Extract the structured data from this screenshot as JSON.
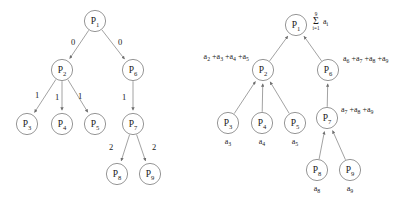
{
  "figure": {
    "background_color": "#ffffff",
    "stroke_color": "#8a8a8a",
    "text_color": "#1a1a1a",
    "left_diagram": {
      "name": "broadcast-tree-with-step-labels",
      "nodes": [
        {
          "id": "P1",
          "base": "P",
          "sub": "1",
          "x": 95,
          "y": 21
        },
        {
          "id": "P2",
          "base": "P",
          "sub": "2",
          "x": 62,
          "y": 70
        },
        {
          "id": "P6",
          "base": "P",
          "sub": "6",
          "x": 133,
          "y": 70
        },
        {
          "id": "P3",
          "base": "P",
          "sub": "3",
          "x": 27,
          "y": 124
        },
        {
          "id": "P4",
          "base": "P",
          "sub": "4",
          "x": 62,
          "y": 124
        },
        {
          "id": "P5",
          "base": "P",
          "sub": "5",
          "x": 95,
          "y": 124
        },
        {
          "id": "P7",
          "base": "P",
          "sub": "7",
          "x": 133,
          "y": 124
        },
        {
          "id": "P8",
          "base": "P",
          "sub": "8",
          "x": 117,
          "y": 174
        },
        {
          "id": "P9",
          "base": "P",
          "sub": "9",
          "x": 150,
          "y": 174
        }
      ],
      "edges": [
        {
          "from": "P1",
          "to": "P2",
          "weight": "0",
          "label_x": 73,
          "label_y": 45
        },
        {
          "from": "P1",
          "to": "P6",
          "weight": "0",
          "label_x": 120,
          "label_y": 45
        },
        {
          "from": "P2",
          "to": "P3",
          "weight": "1",
          "label_x": 37,
          "label_y": 98
        },
        {
          "from": "P2",
          "to": "P4",
          "weight": "1",
          "label_x": 57,
          "label_y": 100
        },
        {
          "from": "P2",
          "to": "P5",
          "weight": "1",
          "label_x": 80,
          "label_y": 99
        },
        {
          "from": "P6",
          "to": "P7",
          "weight": "1",
          "label_x": 124,
          "label_y": 100
        },
        {
          "from": "P7",
          "to": "P8",
          "weight": "2",
          "label_x": 111,
          "label_y": 150
        },
        {
          "from": "P7",
          "to": "P9",
          "weight": "2",
          "label_x": 154,
          "label_y": 150
        }
      ]
    },
    "right_diagram": {
      "name": "reduction-tree-with-partial-sums",
      "nodes": [
        {
          "id": "P1",
          "base": "P",
          "sub": "1",
          "x": 296,
          "y": 25
        },
        {
          "id": "P2",
          "base": "P",
          "sub": "2",
          "x": 263,
          "y": 70
        },
        {
          "id": "P6",
          "base": "P",
          "sub": "6",
          "x": 328,
          "y": 70
        },
        {
          "id": "P3",
          "base": "P",
          "sub": "3",
          "x": 228,
          "y": 123
        },
        {
          "id": "P4",
          "base": "P",
          "sub": "4",
          "x": 262,
          "y": 123
        },
        {
          "id": "P5",
          "base": "P",
          "sub": "5",
          "x": 295,
          "y": 123
        },
        {
          "id": "P7",
          "base": "P",
          "sub": "7",
          "x": 327,
          "y": 118
        },
        {
          "id": "P8",
          "base": "P",
          "sub": "8",
          "x": 317,
          "y": 170
        },
        {
          "id": "P9",
          "base": "P",
          "sub": "9",
          "x": 350,
          "y": 170
        }
      ],
      "edges": [
        {
          "from": "P2",
          "to": "P1"
        },
        {
          "from": "P6",
          "to": "P1"
        },
        {
          "from": "P3",
          "to": "P2"
        },
        {
          "from": "P4",
          "to": "P2"
        },
        {
          "from": "P5",
          "to": "P2"
        },
        {
          "from": "P7",
          "to": "P6"
        },
        {
          "from": "P8",
          "to": "P7"
        },
        {
          "from": "P9",
          "to": "P7"
        }
      ],
      "root_summation": {
        "operator": "Σ",
        "lower_limit": "i=1",
        "upper_limit": "9",
        "operand_base": "a",
        "operand_sub": "i",
        "x": 316,
        "y": 24
      },
      "annotations": [
        {
          "id": "p2-partial-sum",
          "terms": [
            {
              "base": "a",
              "sub": "2"
            },
            {
              "base": "a",
              "sub": "3"
            },
            {
              "base": "a",
              "sub": "4"
            },
            {
              "base": "a",
              "sub": "5"
            }
          ],
          "x": 249,
          "y": 59,
          "anchor": "end"
        },
        {
          "id": "p6-partial-sum",
          "terms": [
            {
              "base": "a",
              "sub": "6"
            },
            {
              "base": "a",
              "sub": "7"
            },
            {
              "base": "a",
              "sub": "8"
            },
            {
              "base": "a",
              "sub": "9"
            }
          ],
          "x": 343,
          "y": 61,
          "anchor": "start"
        },
        {
          "id": "p7-partial-sum",
          "terms": [
            {
              "base": "a",
              "sub": "7"
            },
            {
              "base": "a",
              "sub": "8"
            },
            {
              "base": "a",
              "sub": "9"
            }
          ],
          "x": 341,
          "y": 112,
          "anchor": "start"
        }
      ],
      "leaf_values": [
        {
          "id": "p3-value",
          "base": "a",
          "sub": "3",
          "x": 228,
          "y": 144
        },
        {
          "id": "p4-value",
          "base": "a",
          "sub": "4",
          "x": 262,
          "y": 144
        },
        {
          "id": "p5-value",
          "base": "a",
          "sub": "5",
          "x": 295,
          "y": 144
        },
        {
          "id": "p8-value",
          "base": "a",
          "sub": "8",
          "x": 317,
          "y": 191
        },
        {
          "id": "p9-value",
          "base": "a",
          "sub": "9",
          "x": 350,
          "y": 191
        }
      ]
    }
  }
}
